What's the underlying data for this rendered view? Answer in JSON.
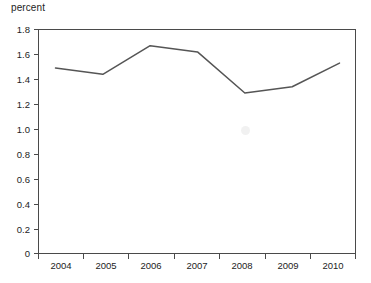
{
  "chart_data": {
    "type": "line",
    "title": "",
    "subtitle": "",
    "xlabel": "",
    "ylabel": "percent",
    "categories": [
      "2004",
      "2005",
      "2006",
      "2007",
      "2008",
      "2009",
      "2010"
    ],
    "x": [
      2004,
      2005,
      2006,
      2007,
      2008,
      2009,
      2010
    ],
    "values": [
      1.49,
      1.44,
      1.67,
      1.62,
      1.29,
      1.34,
      1.53
    ],
    "series": [
      {
        "name": "percent",
        "values": [
          1.49,
          1.44,
          1.67,
          1.62,
          1.29,
          1.34,
          1.53
        ]
      }
    ],
    "ylim": [
      0,
      1.8
    ],
    "yticks": [
      0,
      0.2,
      0.4,
      0.6,
      0.8,
      1.0,
      1.2,
      1.4,
      1.6,
      1.8
    ],
    "ytick_labels": [
      "0",
      "0.2",
      "0.4",
      "0.6",
      "0.8",
      "1.0",
      "1.2",
      "1.4",
      "1.6",
      "1.8"
    ],
    "xtick_labels": [
      "2004",
      "2005",
      "2006",
      "2007",
      "2008",
      "2009",
      "2010"
    ],
    "grid": false,
    "legend": false,
    "legend_position": "none",
    "line_color": "#555555",
    "axis_color": "#4a4a4a",
    "background_color": "#ffffff",
    "annotations": []
  },
  "axis": {
    "y_label": "percent"
  },
  "y_ticks": [
    {
      "label": "1.8"
    },
    {
      "label": "1.6"
    },
    {
      "label": "1.4"
    },
    {
      "label": "1.2"
    },
    {
      "label": "1.0"
    },
    {
      "label": "0.8"
    },
    {
      "label": "0.6"
    },
    {
      "label": "0.4"
    },
    {
      "label": "0.2"
    },
    {
      "label": "0"
    }
  ],
  "x_ticks": [
    {
      "label": "2004"
    },
    {
      "label": "2005"
    },
    {
      "label": "2006"
    },
    {
      "label": "2007"
    },
    {
      "label": "2008"
    },
    {
      "label": "2009"
    },
    {
      "label": "2010"
    }
  ]
}
